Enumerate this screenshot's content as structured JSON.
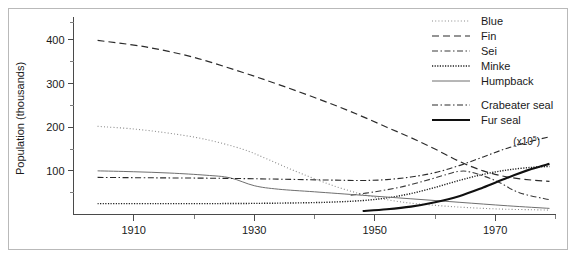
{
  "figure": {
    "annotation": "(x10",
    "annotation_sup": "5",
    "annotation_close": ")"
  },
  "chart_data": {
    "type": "line",
    "title": "",
    "xlabel": "",
    "ylabel": "Population (thousands)",
    "xlim": [
      1900,
      1980
    ],
    "ylim": [
      0,
      440
    ],
    "grid": false,
    "legend_position": "right",
    "x_ticks_major": [
      1910,
      1930,
      1950,
      1970
    ],
    "x_tick_labels": [
      "1910",
      "1930",
      "1950",
      "1970"
    ],
    "x_ticks_minor": [
      1920,
      1940,
      1960,
      1980
    ],
    "y_ticks_major": [
      100,
      200,
      300,
      400
    ],
    "y_tick_labels": [
      "100",
      "200",
      "300",
      "400"
    ],
    "y_ticks_minor": [
      50,
      150,
      250,
      350,
      440
    ],
    "annotations": [
      {
        "text": "(x10^5)",
        "x": 1973,
        "y": 160,
        "refers_to": "Crabeater seal"
      }
    ],
    "series": [
      {
        "name": "Blue",
        "style": "fine-dotted",
        "color": "#8a8a8a",
        "width": 1.1,
        "dash": "1,2.2",
        "x": [
          1904,
          1910,
          1916,
          1922,
          1928,
          1932,
          1936,
          1940,
          1944,
          1948,
          1952,
          1956,
          1960,
          1964,
          1968,
          1972,
          1976,
          1979
        ],
        "y": [
          202,
          196,
          186,
          172,
          150,
          128,
          104,
          82,
          62,
          46,
          34,
          26,
          21,
          17,
          14,
          12,
          11,
          10
        ]
      },
      {
        "name": "Fin",
        "style": "dashed",
        "color": "#2b2b2b",
        "width": 1.2,
        "dash": "7,4",
        "x": [
          1904,
          1912,
          1920,
          1928,
          1934,
          1940,
          1946,
          1952,
          1956,
          1960,
          1964,
          1968,
          1972,
          1976,
          1979
        ],
        "y": [
          399,
          384,
          360,
          326,
          298,
          268,
          236,
          200,
          176,
          150,
          122,
          100,
          86,
          79,
          76
        ]
      },
      {
        "name": "Sei",
        "style": "dash-dot",
        "color": "#3a3a3a",
        "width": 1.1,
        "dash": "6,2.5,1.5,2.5",
        "x": [
          1946,
          1950,
          1954,
          1958,
          1962,
          1964,
          1966,
          1970,
          1974,
          1979
        ],
        "y": [
          44,
          52,
          62,
          76,
          92,
          99,
          97,
          78,
          50,
          34
        ]
      },
      {
        "name": "Minke",
        "style": "dense-dotted",
        "color": "#1f1f1f",
        "width": 1.4,
        "dash": "1.2,1.4",
        "x": [
          1904,
          1914,
          1924,
          1934,
          1942,
          1948,
          1952,
          1956,
          1960,
          1964,
          1968,
          1972,
          1976,
          1979
        ],
        "y": [
          25,
          25,
          25,
          26,
          28,
          32,
          38,
          48,
          62,
          78,
          92,
          102,
          108,
          110
        ]
      },
      {
        "name": "Humpback",
        "style": "solid-thin",
        "color": "#6f6f6f",
        "width": 1.0,
        "dash": "",
        "x": [
          1904,
          1910,
          1916,
          1922,
          1926,
          1930,
          1934,
          1940,
          1948,
          1956,
          1964,
          1972,
          1979
        ],
        "y": [
          100,
          98,
          95,
          90,
          84,
          66,
          58,
          52,
          44,
          36,
          28,
          20,
          14
        ]
      },
      {
        "name": "Crabeater seal",
        "style": "dash-dot",
        "color": "#2b2b2b",
        "width": 1.1,
        "dash": "6,2.5,1.5,2.5",
        "x": [
          1904,
          1914,
          1924,
          1934,
          1942,
          1948,
          1952,
          1956,
          1960,
          1964,
          1968,
          1972,
          1976,
          1979
        ],
        "y": [
          85,
          84,
          83,
          81,
          79,
          78,
          80,
          86,
          96,
          112,
          132,
          152,
          168,
          178
        ]
      },
      {
        "name": "Fur seal",
        "style": "solid-thick",
        "color": "#101010",
        "width": 2.1,
        "dash": "",
        "x": [
          1948,
          1952,
          1956,
          1960,
          1964,
          1968,
          1972,
          1976,
          1979
        ],
        "y": [
          8,
          12,
          18,
          28,
          42,
          62,
          84,
          104,
          116
        ]
      }
    ]
  },
  "legend": {
    "items": [
      {
        "label": "Blue",
        "style": "fine-dotted"
      },
      {
        "label": "Fin",
        "style": "dashed"
      },
      {
        "label": "Sei",
        "style": "dash-dot"
      },
      {
        "label": "Minke",
        "style": "dense-dotted"
      },
      {
        "label": "Humpback",
        "style": "solid-thin"
      },
      {
        "label": "Crabeater seal",
        "style": "dash-dot"
      },
      {
        "label": "Fur seal",
        "style": "solid-thick"
      }
    ]
  }
}
